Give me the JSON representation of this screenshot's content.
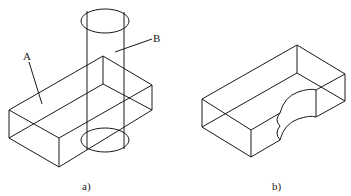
{
  "figures": [
    {
      "id": "a",
      "caption": "a)",
      "description": "Rectangular block A intersected by vertical cylinder B",
      "labels": [
        {
          "text": "A",
          "refers_to": "rectangular block"
        },
        {
          "text": "B",
          "refers_to": "cylinder"
        }
      ]
    },
    {
      "id": "b",
      "caption": "b)",
      "description": "Block with semicircular cut-out resulting from subtracting cylinder B from block A"
    }
  ],
  "colors": {
    "line": "#1a1a1a",
    "background": "#ffffff"
  }
}
